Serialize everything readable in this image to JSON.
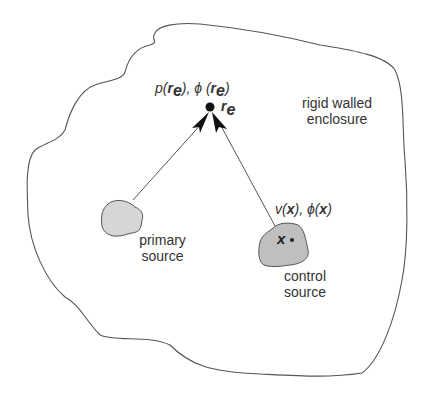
{
  "diagram": {
    "title": "",
    "enclosure": {
      "label_line1": "rigid  walled",
      "label_line2": "enclosure"
    },
    "error_point": {
      "field_label": {
        "p": "p(",
        "r1": "r",
        "e1": "e",
        "mid": "), ϕ (",
        "r2": "r",
        "e2": "e",
        "close": ")"
      },
      "point_label": {
        "r": "r",
        "e": "e"
      }
    },
    "primary_source": {
      "label_line1": "primary",
      "label_line2": "source"
    },
    "control_source": {
      "field_label": {
        "v": "v(",
        "x1": "x",
        "mid": "),  ϕ(",
        "x2": "x",
        "close": ")"
      },
      "inner_point_label": "x",
      "label_line1": "control",
      "label_line2": "source"
    },
    "colors": {
      "line": "#555555",
      "source_fill": "#d4d4d4",
      "control_fill": "#bdbdbd",
      "text": "#333333"
    }
  }
}
